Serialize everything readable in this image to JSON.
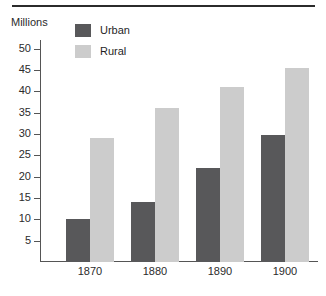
{
  "chart_data": {
    "type": "bar",
    "title": "",
    "subtitle": "",
    "ylabel": "Millions",
    "xlabel": "",
    "categories": [
      "1870",
      "1880",
      "1890",
      "1900"
    ],
    "series": [
      {
        "name": "Urban",
        "color": "#58585a",
        "values": [
          10,
          14,
          22,
          29.7
        ]
      },
      {
        "name": "Rural",
        "color": "#cccccc",
        "values": [
          29,
          36,
          41,
          45.5
        ]
      }
    ],
    "ylim": [
      0,
      52
    ],
    "yticks": [
      5,
      10,
      15,
      20,
      25,
      30,
      35,
      40,
      45,
      50
    ],
    "ytick_labels": [
      "5",
      "10",
      "15",
      "20",
      "25",
      "30",
      "35",
      "40",
      "45",
      "50"
    ],
    "grid": false,
    "legend_position": "top-left-inside",
    "axis_color": "#555555",
    "rule_color": "#2b2b2b"
  },
  "legend": {
    "items": [
      {
        "label": "Urban",
        "color": "#58585a"
      },
      {
        "label": "Rural",
        "color": "#cccccc"
      }
    ]
  }
}
